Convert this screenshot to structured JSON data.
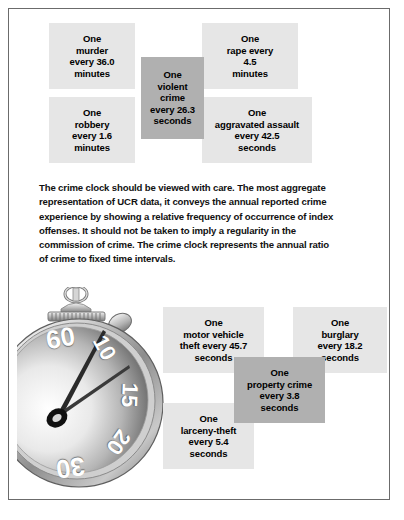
{
  "figure": {
    "title": "Crime Clock",
    "note": "The crime clock should be viewed with care. The most aggregate representation of UCR data, it conveys the annual reported crime experience by showing a relative frequency of occurrence of index offenses. It should not be taken to imply a regularity in the commission of crime. The crime clock represents the annual ratio of crime to fixed time intervals."
  },
  "colors": {
    "box_light": "#e6e6e6",
    "box_dark": "#b0b0b0",
    "border": "#6b6b6b",
    "page": "#ffffff",
    "text": "#000000"
  },
  "violent_crimes": {
    "center": {
      "line1": "One",
      "line2": "violent",
      "line3": "crime",
      "line4": "every 26.3",
      "line5": "seconds",
      "offense": "violent crime",
      "interval": "26.3 seconds",
      "emphasis": "dark"
    },
    "murder": {
      "line1": "One",
      "line2": "murder",
      "line3": "every 36.0",
      "line4": "minutes",
      "offense": "murder",
      "interval": "36.0 minutes"
    },
    "rape": {
      "line1": "One",
      "line2": "rape every",
      "line3": "4.5",
      "line4": "minutes",
      "offense": "rape",
      "interval": "4.5 minutes"
    },
    "robbery": {
      "line1": "One",
      "line2": "robbery",
      "line3": "every 1.6",
      "line4": "minutes",
      "offense": "robbery",
      "interval": "1.6 minutes"
    },
    "aggravated_assault": {
      "line1": "One",
      "line2": "aggravated assault",
      "line3": "every 42.5",
      "line4": "seconds",
      "offense": "aggravated assault",
      "interval": "42.5 seconds"
    }
  },
  "property_crimes": {
    "center": {
      "line1": "One",
      "line2": "property crime",
      "line3": "every 3.8",
      "line4": "seconds",
      "offense": "property crime",
      "interval": "3.8 seconds",
      "emphasis": "dark"
    },
    "motor_vehicle_theft": {
      "line1": "One",
      "line2": "motor vehicle",
      "line3": "theft every 45.7",
      "line4": "seconds",
      "offense": "motor vehicle theft",
      "interval": "45.7 seconds"
    },
    "burglary": {
      "line1": "One",
      "line2": "burglary",
      "line3": "every 18.2",
      "line4": "seconds",
      "offense": "burglary",
      "interval": "18.2 seconds"
    },
    "larceny_theft": {
      "line1": "One",
      "line2": "larceny-theft",
      "line3": "every 5.4",
      "line4": "seconds",
      "offense": "larceny-theft",
      "interval": "5.4 seconds"
    }
  },
  "stopwatch": {
    "dial_numbers": [
      "60",
      "10",
      "15",
      "20",
      "30"
    ],
    "n60": "60",
    "n10": "10",
    "n15": "15",
    "n20": "20",
    "n30": "30"
  }
}
